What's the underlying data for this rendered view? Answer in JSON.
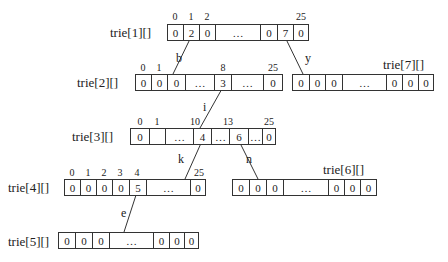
{
  "diagram": {
    "type": "trie-array-structure",
    "arrays": [
      {
        "name": "trie[1][]",
        "cells": [
          "0",
          "2",
          "0",
          "…",
          "0",
          "7",
          "0"
        ],
        "indices": [
          {
            "label": "0",
            "cell": 0
          },
          {
            "label": "1",
            "cell": 1
          },
          {
            "label": "2",
            "cell": 2
          },
          {
            "label": "25",
            "cell": 6
          }
        ]
      },
      {
        "name": "trie[2][]",
        "cells": [
          "0",
          "0",
          "0",
          "…",
          "3",
          "…",
          "0"
        ],
        "indices": [
          {
            "label": "0",
            "cell": 0
          },
          {
            "label": "1",
            "cell": 1
          },
          {
            "label": "8",
            "cell": 4
          },
          {
            "label": "25",
            "cell": 6
          }
        ]
      },
      {
        "name": "trie[7][]",
        "cells": [
          "0",
          "0",
          "0",
          "…",
          "0",
          "0",
          "0"
        ],
        "indices": []
      },
      {
        "name": "trie[3][]",
        "cells": [
          "0",
          "",
          "…",
          "4",
          "…",
          "6",
          "…",
          "0"
        ],
        "indices": [
          {
            "label": "0",
            "cell": 0
          },
          {
            "label": "1",
            "cell": 1
          },
          {
            "label": "10",
            "cell": 3
          },
          {
            "label": "13",
            "cell": 5
          },
          {
            "label": "25",
            "cell": 7
          }
        ]
      },
      {
        "name": "trie[4][]",
        "cells": [
          "0",
          "0",
          "0",
          "0",
          "5",
          "…",
          "0"
        ],
        "indices": [
          {
            "label": "0",
            "cell": 0
          },
          {
            "label": "1",
            "cell": 1
          },
          {
            "label": "2",
            "cell": 2
          },
          {
            "label": "3",
            "cell": 3
          },
          {
            "label": "4",
            "cell": 4
          },
          {
            "label": "25",
            "cell": 6
          }
        ]
      },
      {
        "name": "trie[6][]",
        "cells": [
          "0",
          "0",
          "0",
          "…",
          "0",
          "0",
          "0"
        ],
        "indices": []
      },
      {
        "name": "trie[5][]",
        "cells": [
          "0",
          "0",
          "0",
          "…",
          "0",
          "0",
          "0"
        ],
        "indices": []
      }
    ],
    "edges": [
      {
        "from": "trie[1][]",
        "from_index": "1",
        "to": "trie[2][]",
        "label": "b"
      },
      {
        "from": "trie[1][]",
        "from_index": "24",
        "to": "trie[7][]",
        "label": "y"
      },
      {
        "from": "trie[2][]",
        "from_index": "8",
        "to": "trie[3][]",
        "label": "i"
      },
      {
        "from": "trie[3][]",
        "from_index": "10",
        "to": "trie[4][]",
        "label": "k"
      },
      {
        "from": "trie[3][]",
        "from_index": "13",
        "to": "trie[6][]",
        "label": "n"
      },
      {
        "from": "trie[4][]",
        "from_index": "4",
        "to": "trie[5][]",
        "label": "e"
      }
    ]
  }
}
